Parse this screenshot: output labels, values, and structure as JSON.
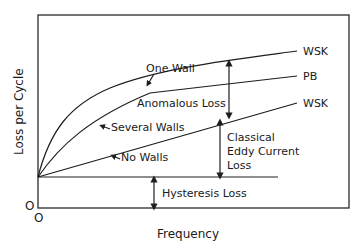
{
  "diagram": {
    "axes": {
      "x_label": "Frequency",
      "y_label": "Loss per Cycle",
      "x_origin": "O",
      "y_origin": "O"
    },
    "curves": [
      {
        "id": "one-wall",
        "label": "One Wall",
        "end_label": "WSK"
      },
      {
        "id": "several-walls",
        "label": "Several Walls",
        "end_label": "PB"
      },
      {
        "id": "no-walls",
        "label": "No Walls",
        "end_label": "WSK"
      }
    ],
    "regions": {
      "anomalous": "Anomalous Loss",
      "classical_line1": "Classical",
      "classical_line2": "Eddy Current",
      "classical_line3": "Loss",
      "hysteresis": "Hysteresis Loss"
    },
    "colors": {
      "line": "#1e1e1e",
      "background": "#ffffff"
    }
  }
}
